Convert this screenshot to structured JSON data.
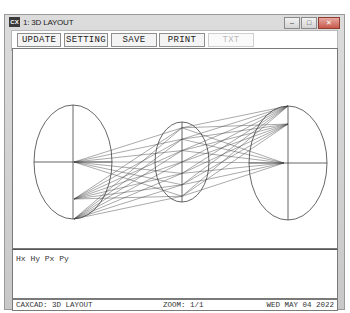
{
  "window": {
    "icon": "app-icon",
    "title": "1: 3D LAYOUT",
    "controls": [
      "minimize",
      "maximize",
      "close"
    ],
    "control_glyphs": {
      "minimize": "–",
      "maximize": "□",
      "close": "✕"
    }
  },
  "toolbar": {
    "buttons": [
      {
        "label": "UPDATE",
        "enabled": true
      },
      {
        "label": "SETTING",
        "enabled": true
      },
      {
        "label": "SAVE",
        "enabled": true
      },
      {
        "label": "PRINT",
        "enabled": true
      },
      {
        "label": "TXT",
        "enabled": false
      }
    ]
  },
  "drawing": {
    "type": "3d-layout-ray-trace",
    "line_color": "#404040",
    "surfaces": [
      {
        "name": "object-plane",
        "cx": 60,
        "cy": 113,
        "rx": 39,
        "ry": 57
      },
      {
        "name": "lens",
        "cx": 169,
        "cy": 113,
        "rx": 27,
        "ry": 40
      },
      {
        "name": "image-plane",
        "cx": 275,
        "cy": 114,
        "rx": 39,
        "ry": 57
      }
    ],
    "source_points": [
      [
        61,
        113
      ],
      [
        61,
        150
      ],
      [
        61,
        170
      ]
    ],
    "target_points": [
      [
        275,
        57
      ],
      [
        275,
        75
      ],
      [
        271,
        114
      ]
    ]
  },
  "output": {
    "text": "Hx Hy Px Py"
  },
  "status": {
    "left": "CAXCAD: 3D LAYOUT",
    "zoom": "ZOOM: 1/1",
    "date": "WED MAY 04 2022"
  }
}
